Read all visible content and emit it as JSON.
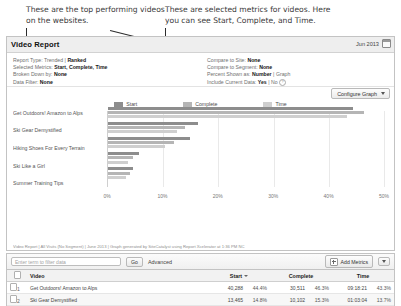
{
  "annotations": {
    "left": "These are the top performing videos on the websites.",
    "right": "These are selected metrics for videos. Here you can see Start, Complete, and Time."
  },
  "panel": {
    "title": "Video Report",
    "date_label": "Jun 2013",
    "calendar_icon": "calendar-icon"
  },
  "settings": {
    "left": [
      {
        "label": "Report Type:",
        "option_a": "Trended",
        "sep": "|",
        "option_b": "Ranked",
        "selected": "Ranked"
      },
      {
        "label": "Selected Metrics:",
        "value": "Start, Complete, Time"
      },
      {
        "label": "Broken Down by:",
        "value": "None"
      },
      {
        "label": "Data Filter:",
        "value": "None"
      }
    ],
    "right": [
      {
        "label": "Compare to Site:",
        "value": "None"
      },
      {
        "label": "Compare to Segment:",
        "value": "None"
      },
      {
        "label": "Percent Shown as:",
        "option_a": "Number",
        "sep": "|",
        "option_b": "Graph",
        "selected": "Number"
      },
      {
        "label": "Include Current Data:",
        "option_a": "Yes",
        "sep": "|",
        "option_b": "No",
        "selected": "Yes",
        "help": "?"
      }
    ]
  },
  "configure_graph_label": "Configure Graph",
  "chart_data": {
    "type": "bar",
    "orientation": "horizontal",
    "title": "Video Report",
    "xlabel": "",
    "ylabel": "",
    "xlim": [
      0,
      50
    ],
    "xticks": [
      "0%",
      "10%",
      "20%",
      "30%",
      "40%",
      "50%"
    ],
    "xtick_values": [
      0,
      10,
      20,
      30,
      40,
      50
    ],
    "grid": true,
    "legend_position": "top-center",
    "categories": [
      "Get Outdoors! Amazon to Alps",
      "Ski Gear Demystified",
      "Hiking Shoes For Every Terrain",
      "Ski Like a Girl",
      "Summer Training Tips"
    ],
    "series": [
      {
        "name": "Start",
        "color": "#8d8d8d",
        "values": [
          44.4,
          16.3,
          14.8,
          5.6,
          4.6
        ]
      },
      {
        "name": "Complete",
        "color": "#b5b5b5",
        "values": [
          46.3,
          14.0,
          12.0,
          4.6,
          3.9
        ]
      },
      {
        "name": "Time",
        "color": "#cfcfcf",
        "values": [
          43.3,
          12.5,
          10.4,
          3.7,
          3.2
        ]
      }
    ]
  },
  "footnote": "Video Report | All Visits (No Segment) | June 2013 | Graph generated by SiteCatalyst using Report Xcelerator at 1:36 PM NC",
  "toolbar": {
    "search_placeholder": "Enter term to filter data",
    "go_label": "Go",
    "advanced_label": "Advanced",
    "add_metrics_label": "Add Metrics",
    "add_metrics_icon": "plus-icon",
    "dropdown_icon": "chevron-down-icon"
  },
  "table": {
    "headers": {
      "select": "",
      "video": "Video",
      "start": "Start",
      "complete": "Complete",
      "time": "Time"
    },
    "sorted_by": "Start",
    "rows": [
      {
        "rank": "1",
        "video": "Get Outdoors! Amazon to Alps",
        "start_value": "40,288",
        "start_pct": "44.4%",
        "complete_value": "30,511",
        "complete_pct": "46.3%",
        "time_value": "09:18:21",
        "time_pct": "43.3%"
      },
      {
        "rank": "2",
        "video": "Ski Gear Demystified",
        "start_value": "13,465",
        "start_pct": "14.8%",
        "complete_value": "10,102",
        "complete_pct": "15.3%",
        "time_value": "01:03:04",
        "time_pct": "13.7%"
      }
    ]
  }
}
